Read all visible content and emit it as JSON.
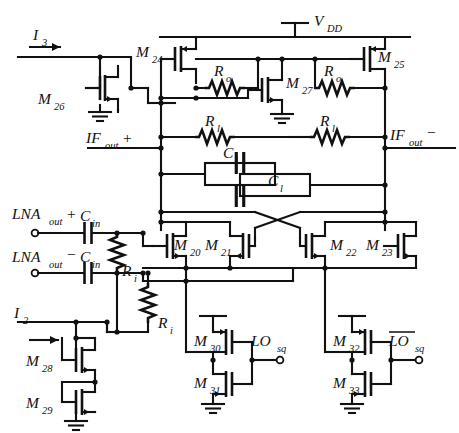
{
  "figure": {
    "type": "circuit-schematic"
  },
  "supply": {
    "label": "V",
    "sub": "DD"
  },
  "currents": [
    {
      "name": "current-source-i3",
      "label": "I",
      "sub": "3"
    },
    {
      "name": "current-source-i2",
      "label": "I",
      "sub": "2"
    }
  ],
  "ports": [
    {
      "name": "if-out-plus",
      "label": "IF",
      "sub": "out",
      "sign": "+"
    },
    {
      "name": "if-out-minus",
      "label": "IF",
      "sub": "out",
      "sign": "−"
    },
    {
      "name": "lna-out-plus",
      "label": "LNA",
      "sub": "out",
      "sign": "+"
    },
    {
      "name": "lna-out-minus",
      "label": "LNA",
      "sub": "out",
      "sign": "−"
    },
    {
      "name": "lo-sq",
      "label": "LO",
      "sub": "sq",
      "overbar": false
    },
    {
      "name": "lo-sq-bar",
      "label": "LO",
      "sub": "sq",
      "overbar": true
    }
  ],
  "transistors": [
    {
      "id": "M20",
      "label": "M",
      "sub": "20",
      "type": "nmos"
    },
    {
      "id": "M21",
      "label": "M",
      "sub": "21",
      "type": "nmos"
    },
    {
      "id": "M22",
      "label": "M",
      "sub": "22",
      "type": "nmos"
    },
    {
      "id": "M23",
      "label": "M",
      "sub": "23",
      "type": "nmos"
    },
    {
      "id": "M24",
      "label": "M",
      "sub": "24",
      "type": "pmos"
    },
    {
      "id": "M25",
      "label": "M",
      "sub": "25",
      "type": "pmos"
    },
    {
      "id": "M26",
      "label": "M",
      "sub": "26",
      "type": "nmos"
    },
    {
      "id": "M27",
      "label": "M",
      "sub": "27",
      "type": "nmos"
    },
    {
      "id": "M28",
      "label": "M",
      "sub": "28",
      "type": "nmos"
    },
    {
      "id": "M29",
      "label": "M",
      "sub": "29",
      "type": "nmos"
    },
    {
      "id": "M30",
      "label": "M",
      "sub": "30",
      "type": "pmos"
    },
    {
      "id": "M31",
      "label": "M",
      "sub": "31",
      "type": "nmos"
    },
    {
      "id": "M32",
      "label": "M",
      "sub": "32",
      "type": "pmos"
    },
    {
      "id": "M33",
      "label": "M",
      "sub": "33",
      "type": "nmos"
    }
  ],
  "passives": [
    {
      "id": "Ro-left",
      "label": "R",
      "sub": "o",
      "kind": "resistor"
    },
    {
      "id": "Ro-right",
      "label": "R",
      "sub": "o",
      "kind": "resistor"
    },
    {
      "id": "Rl-left",
      "label": "R",
      "sub": "l",
      "kind": "resistor"
    },
    {
      "id": "Rl-right",
      "label": "R",
      "sub": "l",
      "kind": "resistor"
    },
    {
      "id": "Ri-upper",
      "label": "R",
      "sub": "i",
      "kind": "resistor"
    },
    {
      "id": "Ri-lower",
      "label": "R",
      "sub": "i",
      "kind": "resistor"
    },
    {
      "id": "Cl-upper",
      "label": "C",
      "sub": "l",
      "kind": "capacitor"
    },
    {
      "id": "Cl-lower",
      "label": "C",
      "sub": "l",
      "kind": "capacitor"
    },
    {
      "id": "Cin-upper",
      "label": "C",
      "sub": "in",
      "kind": "capacitor"
    },
    {
      "id": "Cin-lower",
      "label": "C",
      "sub": "in",
      "kind": "capacitor"
    }
  ],
  "colors": {
    "ink": "#111111",
    "paper": "#ffffff"
  }
}
